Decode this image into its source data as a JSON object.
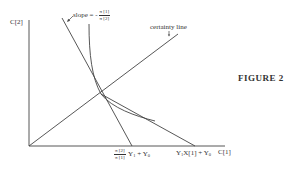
{
  "figure": {
    "caption": "FIGURE 2",
    "axes": {
      "y_label": "C[2]",
      "x_label": "C[1]"
    },
    "annotations": {
      "slope_prefix": "slope = -",
      "slope_num": "π [1]",
      "slope_den": "π [2]",
      "certainty_line": "certainty line",
      "x_intercept_1_num": "π [2]",
      "x_intercept_1_den": "π [1]",
      "x_intercept_1_y1": "Y",
      "x_intercept_1_y1_sub": "1",
      "x_intercept_1_plus": " + ",
      "x_intercept_1_y0": "Y",
      "x_intercept_1_y0_sub": "0",
      "x_intercept_2_y1": "Y",
      "x_intercept_2_y1_sub": "1",
      "x_intercept_2_x": "X[1] + ",
      "x_intercept_2_y0": "Y",
      "x_intercept_2_y0_sub": "0"
    },
    "elements": [
      "vertical axis C[2]",
      "horizontal axis C[1]",
      "certainty line from origin",
      "steep line with slope -π[1]/π[2]",
      "budget line to Y1X[1]+Y0",
      "convex indifference curve tangent at intersection"
    ],
    "colors": {
      "ink": "#333333",
      "background": "#ffffff"
    }
  }
}
